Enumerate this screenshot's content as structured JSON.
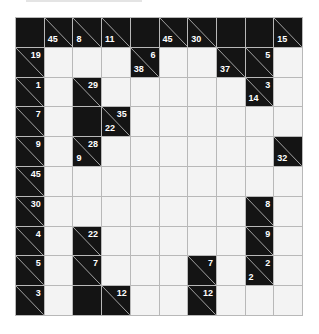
{
  "puzzle": {
    "type": "kakuro",
    "rows": 10,
    "cols": 10,
    "colors": {
      "black": "#141414",
      "white": "#f3f3f3",
      "grid_line": "#b8b8b8",
      "clue_text": "#ffffff"
    },
    "grid": [
      [
        {
          "t": "b"
        },
        {
          "t": "c",
          "d": "45"
        },
        {
          "t": "c",
          "d": "8"
        },
        {
          "t": "c",
          "d": "11"
        },
        {
          "t": "b"
        },
        {
          "t": "c",
          "d": "45"
        },
        {
          "t": "c",
          "d": "30"
        },
        {
          "t": "b"
        },
        {
          "t": "b"
        },
        {
          "t": "c",
          "d": "15"
        }
      ],
      [
        {
          "t": "c",
          "a": "19"
        },
        {
          "t": "w"
        },
        {
          "t": "w"
        },
        {
          "t": "w"
        },
        {
          "t": "c",
          "a": "6",
          "d": "38"
        },
        {
          "t": "w"
        },
        {
          "t": "w"
        },
        {
          "t": "c",
          "d": "37"
        },
        {
          "t": "c",
          "a": "5"
        },
        {
          "t": "w"
        }
      ],
      [
        {
          "t": "c",
          "a": "1"
        },
        {
          "t": "w"
        },
        {
          "t": "c",
          "a": "29"
        },
        {
          "t": "w"
        },
        {
          "t": "w"
        },
        {
          "t": "w"
        },
        {
          "t": "w"
        },
        {
          "t": "w"
        },
        {
          "t": "c",
          "a": "3",
          "d": "14"
        },
        {
          "t": "w"
        }
      ],
      [
        {
          "t": "c",
          "a": "7"
        },
        {
          "t": "w"
        },
        {
          "t": "b"
        },
        {
          "t": "c",
          "a": "35",
          "d": "22"
        },
        {
          "t": "w"
        },
        {
          "t": "w"
        },
        {
          "t": "w"
        },
        {
          "t": "w"
        },
        {
          "t": "w"
        },
        {
          "t": "w"
        }
      ],
      [
        {
          "t": "c",
          "a": "9"
        },
        {
          "t": "w"
        },
        {
          "t": "c",
          "a": "28",
          "d": "9"
        },
        {
          "t": "w"
        },
        {
          "t": "w"
        },
        {
          "t": "w"
        },
        {
          "t": "w"
        },
        {
          "t": "w"
        },
        {
          "t": "w"
        },
        {
          "t": "c",
          "d": "32"
        }
      ],
      [
        {
          "t": "c",
          "a": "45"
        },
        {
          "t": "w"
        },
        {
          "t": "w"
        },
        {
          "t": "w"
        },
        {
          "t": "w"
        },
        {
          "t": "w"
        },
        {
          "t": "w"
        },
        {
          "t": "w"
        },
        {
          "t": "w"
        },
        {
          "t": "w"
        }
      ],
      [
        {
          "t": "c",
          "a": "30"
        },
        {
          "t": "w"
        },
        {
          "t": "w"
        },
        {
          "t": "w"
        },
        {
          "t": "w"
        },
        {
          "t": "w"
        },
        {
          "t": "w"
        },
        {
          "t": "w"
        },
        {
          "t": "c",
          "a": "8"
        },
        {
          "t": "w"
        }
      ],
      [
        {
          "t": "c",
          "a": "4"
        },
        {
          "t": "w"
        },
        {
          "t": "c",
          "a": "22"
        },
        {
          "t": "w"
        },
        {
          "t": "w"
        },
        {
          "t": "w"
        },
        {
          "t": "w"
        },
        {
          "t": "w"
        },
        {
          "t": "c",
          "a": "9"
        },
        {
          "t": "w"
        }
      ],
      [
        {
          "t": "c",
          "a": "5"
        },
        {
          "t": "w"
        },
        {
          "t": "c",
          "a": "7"
        },
        {
          "t": "w"
        },
        {
          "t": "w"
        },
        {
          "t": "w"
        },
        {
          "t": "c",
          "a": "7"
        },
        {
          "t": "w"
        },
        {
          "t": "c",
          "a": "2",
          "d": "2"
        },
        {
          "t": "w"
        }
      ],
      [
        {
          "t": "c",
          "a": "3"
        },
        {
          "t": "w"
        },
        {
          "t": "b"
        },
        {
          "t": "c",
          "a": "12"
        },
        {
          "t": "w"
        },
        {
          "t": "w"
        },
        {
          "t": "c",
          "a": "12"
        },
        {
          "t": "w"
        },
        {
          "t": "w"
        },
        {
          "t": "w"
        }
      ]
    ]
  }
}
